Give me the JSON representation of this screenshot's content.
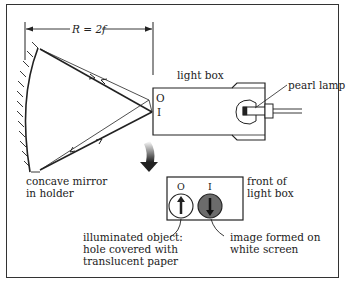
{
  "diagram": {
    "dimension_label": "R = 2f",
    "labels": {
      "light_box": "light box",
      "pearl_lamp": "pearl lamp",
      "object_marker": "O",
      "image_marker": "I",
      "mirror_line1": "concave mirror",
      "mirror_line2": "in holder",
      "front_line1": "front of",
      "front_line2": "light box",
      "front_O": "O",
      "front_I": "I",
      "object_line1": "illuminated object:",
      "object_line2": "hole covered with",
      "object_line3": "translucent paper",
      "image_line1": "image formed on",
      "image_line2": "white screen"
    },
    "colors": {
      "ink": "#222222",
      "image_disc": "#6b6b6b"
    }
  }
}
